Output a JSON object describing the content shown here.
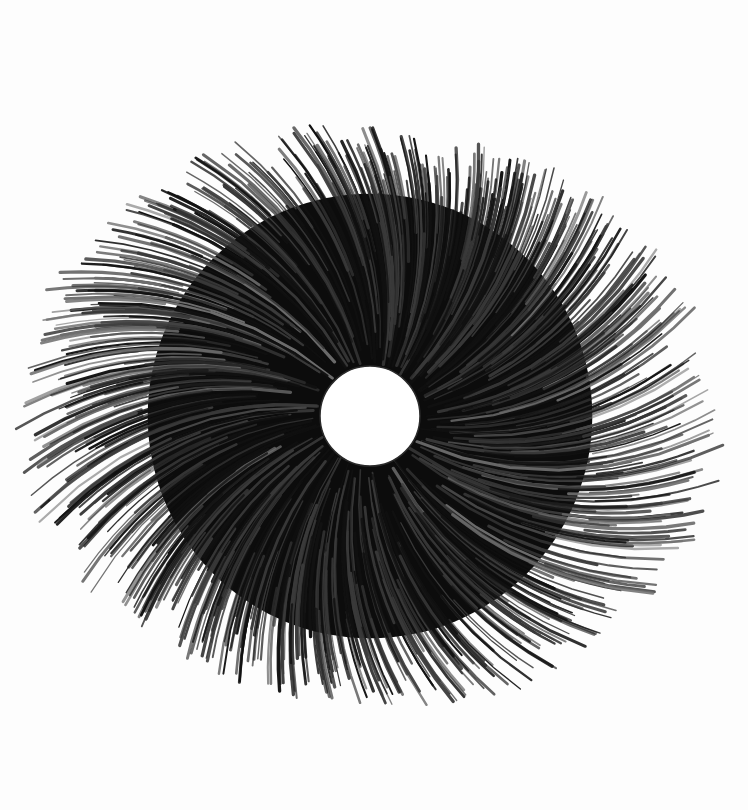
{
  "artwork": {
    "description": "Pencil drawing of a dense swirling radial burst of curved strokes around a white circular center",
    "medium": "graphite pencil on white paper",
    "background_color": "#fdfdfd",
    "stroke_color_dark": "#111111",
    "stroke_color_mid": "#3a3a3a",
    "stroke_color_light": "#6e6e6e",
    "center": {
      "x": 370,
      "y": 416
    },
    "hole_radius": 50,
    "hole_color": "#ffffff",
    "outer_radius_min": 285,
    "outer_radius_max": 360,
    "swirl_direction": "counter-clockwise tips",
    "stroke_count": 900
  }
}
